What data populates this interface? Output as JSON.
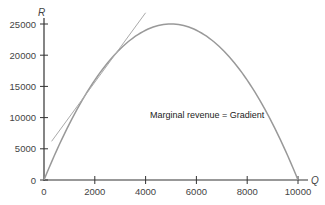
{
  "chart_data": {
    "type": "line",
    "title": "",
    "xlabel": "Q",
    "ylabel": "R",
    "xlim": [
      0,
      10000
    ],
    "ylim": [
      0,
      25000
    ],
    "x_ticks": [
      0,
      2000,
      4000,
      6000,
      8000,
      10000
    ],
    "y_ticks": [
      0,
      5000,
      10000,
      15000,
      20000,
      25000
    ],
    "grid": false,
    "series": [
      {
        "name": "Total revenue R",
        "x": [
          0,
          1000,
          2000,
          3000,
          4000,
          5000,
          6000,
          7000,
          8000,
          9000,
          10000
        ],
        "values": [
          0,
          9000,
          16000,
          21000,
          24000,
          25000,
          24000,
          21000,
          16000,
          9000,
          0
        ]
      },
      {
        "name": "Tangent at Q=2000",
        "x": [
          300,
          4000
        ],
        "values": [
          6200,
          26800
        ]
      }
    ],
    "annotations": [
      "Marginal revenue = Gradient"
    ]
  },
  "labels": {
    "x_axis": "Q",
    "y_axis": "R",
    "annotation": "Marginal revenue = Gradient",
    "x_ticks": [
      "0",
      "2000",
      "4000",
      "6000",
      "8000",
      "10000"
    ],
    "y_ticks": [
      "0",
      "5000",
      "10000",
      "15000",
      "20000",
      "25000"
    ]
  }
}
